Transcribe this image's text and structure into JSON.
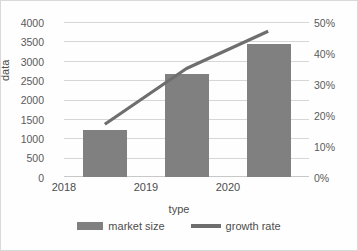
{
  "chart_data": {
    "type": "bar",
    "title": "",
    "xlabel": "type",
    "ylabel": "data",
    "categories": [
      "2018",
      "2019",
      "2020"
    ],
    "series": [
      {
        "name": "market size",
        "type": "bar",
        "axis": "left",
        "values": [
          1220,
          2650,
          3420
        ],
        "color": "#808080"
      },
      {
        "name": "growth rate",
        "type": "line",
        "axis": "right",
        "values": [
          0.17,
          0.35,
          0.47
        ],
        "value_labels": [
          "17%",
          "35%",
          "47%"
        ],
        "color": "#6e6e6e"
      }
    ],
    "ylim": [
      0,
      4000
    ],
    "y2lim": [
      0,
      0.5
    ],
    "y2label": "",
    "left_ticks": [
      "4000",
      "3500",
      "3000",
      "2500",
      "2000",
      "1500",
      "1000",
      "500",
      "0"
    ],
    "right_ticks": [
      "50%",
      "40%",
      "30%",
      "20%",
      "10%",
      "0%"
    ],
    "grid": true,
    "legend_position": "bottom"
  },
  "axes": {
    "y_title": "data",
    "x_title": "type"
  },
  "legend": {
    "items": [
      {
        "label": "market size"
      },
      {
        "label": "growth rate"
      }
    ]
  },
  "colors": {
    "bar": "#808080",
    "line": "#6e6e6e",
    "grid": "#d6d6d6",
    "text": "#4d4d4d",
    "background": "#fefefe",
    "border": "#d9d9d9"
  }
}
